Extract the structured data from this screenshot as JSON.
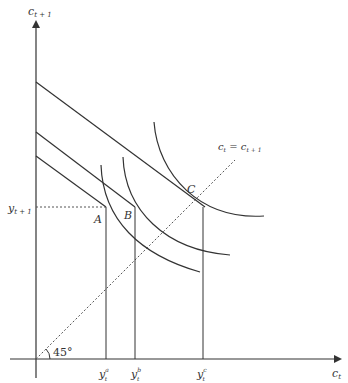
{
  "diagram": {
    "type": "intertemporal-consumption",
    "colors": {
      "line": "#333333",
      "dotted": "#555555",
      "background": "#ffffff"
    },
    "axes": {
      "y_label_base": "c",
      "y_label_sub": "t + 1",
      "x_label_base": "c",
      "x_label_sub": "t"
    },
    "y_tick": {
      "base": "y",
      "sub": "t + 1"
    },
    "x_ticks": [
      {
        "base": "y",
        "sub": "t",
        "sup": "a"
      },
      {
        "base": "y",
        "sub": "t",
        "sup": "b"
      },
      {
        "base": "y",
        "sub": "t",
        "sup": "c"
      }
    ],
    "points": {
      "a": "A",
      "b": "B",
      "c": "C"
    },
    "diagonal_label": {
      "left_base": "c",
      "left_sub": "t",
      "eq": " = ",
      "right_base": "c",
      "right_sub": "t + 1"
    },
    "angle_label": "45°"
  }
}
